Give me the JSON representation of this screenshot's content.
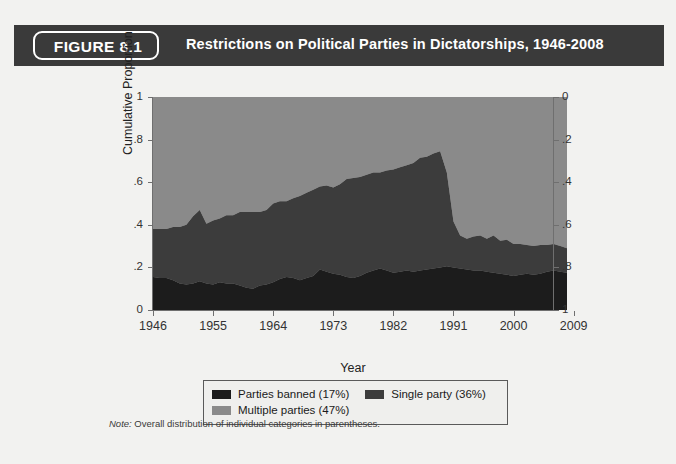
{
  "figure": {
    "badge_label": "FIGURE 8.1",
    "title": "Restrictions on Political Parties in Dictatorships, 1946-2008",
    "note_label": "Note:",
    "note_text": " Overall distribution of individual categories in parentheses."
  },
  "colors": {
    "header_band": "#3a3a3a",
    "page_background": "#f2f2f0",
    "parties_banned": "#1c1c1c",
    "single_party": "#3c3c3c",
    "multiple_parties": "#8a8a8a",
    "axis": "#6f6f6f",
    "text": "#222222"
  },
  "legend": {
    "entries": [
      {
        "label": "Parties banned (17%)",
        "color": "#1c1c1c"
      },
      {
        "label": "Single party (36%)",
        "color": "#3c3c3c"
      },
      {
        "label": "Multiple parties (47%)",
        "color": "#8a8a8a"
      }
    ]
  },
  "axes": {
    "left_label": "Cumulative Proportion",
    "x_label": "Year",
    "left_ticks": [
      "1",
      ".8",
      ".6",
      ".4",
      ".2",
      "0"
    ],
    "left_tick_values": [
      1,
      0.8,
      0.6,
      0.4,
      0.2,
      0
    ],
    "right_ticks": [
      "0",
      ".2",
      ".4",
      ".6",
      ".8",
      "1"
    ],
    "right_tick_values": [
      0,
      0.2,
      0.4,
      0.6,
      0.8,
      1
    ],
    "x_ticks": [
      "1946",
      "1955",
      "1964",
      "1973",
      "1982",
      "1991",
      "2000",
      "2009"
    ],
    "x_tick_values": [
      1946,
      1955,
      1964,
      1973,
      1982,
      1991,
      2000,
      2009
    ]
  },
  "chart_data": {
    "type": "area",
    "title": "Restrictions on Political Parties in Dictatorships, 1946-2008",
    "xlabel": "Year",
    "ylabel": "Cumulative Proportion",
    "xlim": [
      1946,
      2008
    ],
    "ylim": [
      0,
      1
    ],
    "grid": false,
    "stacked": true,
    "legend_position": "below",
    "right_axis": {
      "label": "",
      "ylim": [
        1,
        0
      ],
      "inverted": true
    },
    "x": [
      1946,
      1947,
      1948,
      1949,
      1950,
      1951,
      1952,
      1953,
      1954,
      1955,
      1956,
      1957,
      1958,
      1959,
      1960,
      1961,
      1962,
      1963,
      1964,
      1965,
      1966,
      1967,
      1968,
      1969,
      1970,
      1971,
      1972,
      1973,
      1974,
      1975,
      1976,
      1977,
      1978,
      1979,
      1980,
      1981,
      1982,
      1983,
      1984,
      1985,
      1986,
      1987,
      1988,
      1989,
      1990,
      1991,
      1992,
      1993,
      1994,
      1995,
      1996,
      1997,
      1998,
      1999,
      2000,
      2001,
      2002,
      2003,
      2004,
      2005,
      2006,
      2007,
      2008
    ],
    "series": [
      {
        "name": "Parties banned (17%)",
        "color": "#1c1c1c",
        "overall_share": 0.17,
        "values": [
          0.155,
          0.15,
          0.15,
          0.14,
          0.125,
          0.12,
          0.125,
          0.135,
          0.125,
          0.12,
          0.13,
          0.125,
          0.125,
          0.115,
          0.105,
          0.1,
          0.115,
          0.12,
          0.13,
          0.145,
          0.155,
          0.15,
          0.14,
          0.15,
          0.16,
          0.19,
          0.18,
          0.17,
          0.165,
          0.155,
          0.15,
          0.16,
          0.175,
          0.185,
          0.195,
          0.185,
          0.175,
          0.18,
          0.185,
          0.18,
          0.185,
          0.19,
          0.195,
          0.2,
          0.205,
          0.2,
          0.195,
          0.19,
          0.185,
          0.185,
          0.18,
          0.175,
          0.17,
          0.165,
          0.16,
          0.165,
          0.17,
          0.165,
          0.17,
          0.18,
          0.185,
          0.18,
          0.175
        ]
      },
      {
        "name": "Single party (36%)",
        "color": "#3c3c3c",
        "overall_share": 0.36,
        "values": [
          0.225,
          0.23,
          0.23,
          0.25,
          0.265,
          0.28,
          0.315,
          0.335,
          0.28,
          0.3,
          0.3,
          0.32,
          0.32,
          0.345,
          0.355,
          0.36,
          0.345,
          0.35,
          0.37,
          0.365,
          0.355,
          0.375,
          0.395,
          0.4,
          0.405,
          0.39,
          0.405,
          0.405,
          0.425,
          0.46,
          0.47,
          0.465,
          0.46,
          0.46,
          0.45,
          0.47,
          0.485,
          0.49,
          0.495,
          0.51,
          0.53,
          0.53,
          0.54,
          0.545,
          0.44,
          0.215,
          0.155,
          0.145,
          0.16,
          0.165,
          0.155,
          0.175,
          0.155,
          0.165,
          0.15,
          0.145,
          0.135,
          0.135,
          0.135,
          0.125,
          0.125,
          0.12,
          0.115
        ]
      },
      {
        "name": "Multiple parties (47%)",
        "color": "#8a8a8a",
        "overall_share": 0.47,
        "values": [
          0.62,
          0.62,
          0.62,
          0.61,
          0.61,
          0.6,
          0.56,
          0.53,
          0.595,
          0.58,
          0.57,
          0.555,
          0.555,
          0.54,
          0.54,
          0.54,
          0.54,
          0.53,
          0.5,
          0.49,
          0.49,
          0.475,
          0.465,
          0.45,
          0.435,
          0.42,
          0.415,
          0.425,
          0.41,
          0.385,
          0.38,
          0.375,
          0.365,
          0.355,
          0.355,
          0.345,
          0.34,
          0.33,
          0.32,
          0.31,
          0.285,
          0.28,
          0.265,
          0.255,
          0.355,
          0.585,
          0.65,
          0.665,
          0.655,
          0.65,
          0.665,
          0.65,
          0.675,
          0.67,
          0.69,
          0.69,
          0.695,
          0.7,
          0.695,
          0.695,
          0.69,
          0.7,
          0.71
        ]
      }
    ]
  }
}
